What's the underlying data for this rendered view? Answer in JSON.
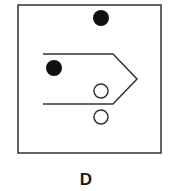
{
  "figure": {
    "label": "D",
    "colors": {
      "stroke": "#333333",
      "fill_dot": "#111111",
      "background": "#ffffff"
    },
    "frame": {
      "x": 18,
      "y": 5,
      "width": 143,
      "height": 148
    },
    "arrow_shape": {
      "points": [
        [
          43,
          54
        ],
        [
          113,
          54
        ],
        [
          137,
          79
        ],
        [
          113,
          104
        ],
        [
          43,
          104
        ]
      ]
    },
    "filled_dots": [
      {
        "cx": 101,
        "cy": 18,
        "r": 8
      },
      {
        "cx": 54,
        "cy": 68,
        "r": 8
      }
    ],
    "open_circles": [
      {
        "cx": 101,
        "cy": 91,
        "r": 7
      },
      {
        "cx": 101,
        "cy": 117,
        "r": 7
      }
    ]
  }
}
